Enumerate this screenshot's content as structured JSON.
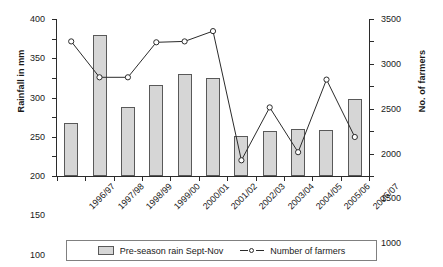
{
  "chart_data": {
    "type": "bar",
    "title": "",
    "xlabel": "",
    "ylabel": "Rainfall in mm",
    "y2label": "No. of farmers",
    "ylim": [
      0,
      400
    ],
    "y2lim": [
      0,
      3500
    ],
    "grid": false,
    "legend_position": "bottom",
    "categories": [
      "1996/97",
      "1997/98",
      "1998/99",
      "1999/00",
      "2000/01",
      "2001/02",
      "2002/03",
      "2003/04",
      "2004/05",
      "2005/06",
      "2006/07"
    ],
    "yticks": [
      0,
      50,
      100,
      150,
      200,
      250,
      300,
      350,
      400
    ],
    "y2ticks": [
      0,
      500,
      1000,
      1500,
      2000,
      2500,
      3000,
      3500
    ],
    "series": [
      {
        "name": "Pre-season rain Sept-Nov",
        "type": "bar",
        "axis": "left",
        "unit": "mm",
        "color": "#d6d6d6",
        "edge_color": "#595959",
        "values": [
          136,
          360,
          175,
          231,
          259,
          250,
          102,
          114,
          119,
          118,
          196
        ]
      },
      {
        "name": "Number of farmers",
        "type": "line",
        "axis": "right",
        "unit": "farmers",
        "color": "#2b2b2b",
        "marker": "open-circle",
        "values": [
          3000,
          2200,
          2200,
          2980,
          3000,
          3230,
          350,
          1530,
          530,
          2150,
          870
        ]
      }
    ]
  },
  "legend": {
    "entries": [
      {
        "label": "Pre-season rain Sept-Nov",
        "swatch": "bar-swatch-icon"
      },
      {
        "label": "Number of farmers",
        "swatch": "line-marker-icon"
      }
    ]
  }
}
